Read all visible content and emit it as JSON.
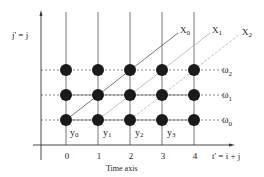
{
  "diagram": {
    "y_axis_label": "j' = j",
    "x_axis_label": "t' = i + j",
    "x_axis_caption": "Time axis",
    "x_ticks": [
      "0",
      "1",
      "2",
      "3",
      "4"
    ],
    "row_labels": [
      {
        "main": "ω",
        "sub": "2"
      },
      {
        "main": "ω",
        "sub": "1"
      },
      {
        "main": "ω",
        "sub": "0"
      }
    ],
    "cell_labels": [
      {
        "main": "y",
        "sub": "0"
      },
      {
        "main": "y",
        "sub": "1"
      },
      {
        "main": "y",
        "sub": "2"
      },
      {
        "main": "y",
        "sub": "3"
      }
    ],
    "diagonal_labels": [
      {
        "main": "X",
        "sub": "0"
      },
      {
        "main": "X",
        "sub": "1"
      },
      {
        "main": "X",
        "sub": "2"
      }
    ],
    "colors": {
      "axis": "#333333",
      "grid": "#555555",
      "node": "#1a1a1a",
      "diag_primary": "#555555",
      "diag_secondary": "#b0b0b0"
    }
  }
}
